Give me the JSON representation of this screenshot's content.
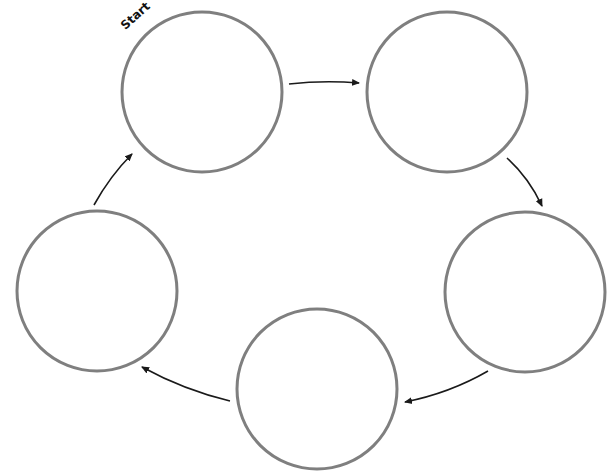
{
  "diagram": {
    "type": "cycle",
    "start_label": "Start",
    "colors": {
      "node_stroke": "#7f7f7f",
      "node_fill": "#ffffff",
      "arrow": "#1a1a1a",
      "label": "#111111"
    },
    "nodes": [
      {
        "id": "node-1",
        "label": "",
        "cx": 202,
        "cy": 92,
        "r": 80
      },
      {
        "id": "node-2",
        "label": "",
        "cx": 447,
        "cy": 92,
        "r": 80
      },
      {
        "id": "node-3",
        "label": "",
        "cx": 525,
        "cy": 292,
        "r": 80
      },
      {
        "id": "node-4",
        "label": "",
        "cx": 317,
        "cy": 389,
        "r": 80
      },
      {
        "id": "node-5",
        "label": "",
        "cx": 97,
        "cy": 291,
        "r": 80
      }
    ],
    "edges": [
      {
        "from": "node-1",
        "to": "node-2"
      },
      {
        "from": "node-2",
        "to": "node-3"
      },
      {
        "from": "node-3",
        "to": "node-4"
      },
      {
        "from": "node-4",
        "to": "node-5"
      },
      {
        "from": "node-5",
        "to": "node-1"
      }
    ]
  }
}
